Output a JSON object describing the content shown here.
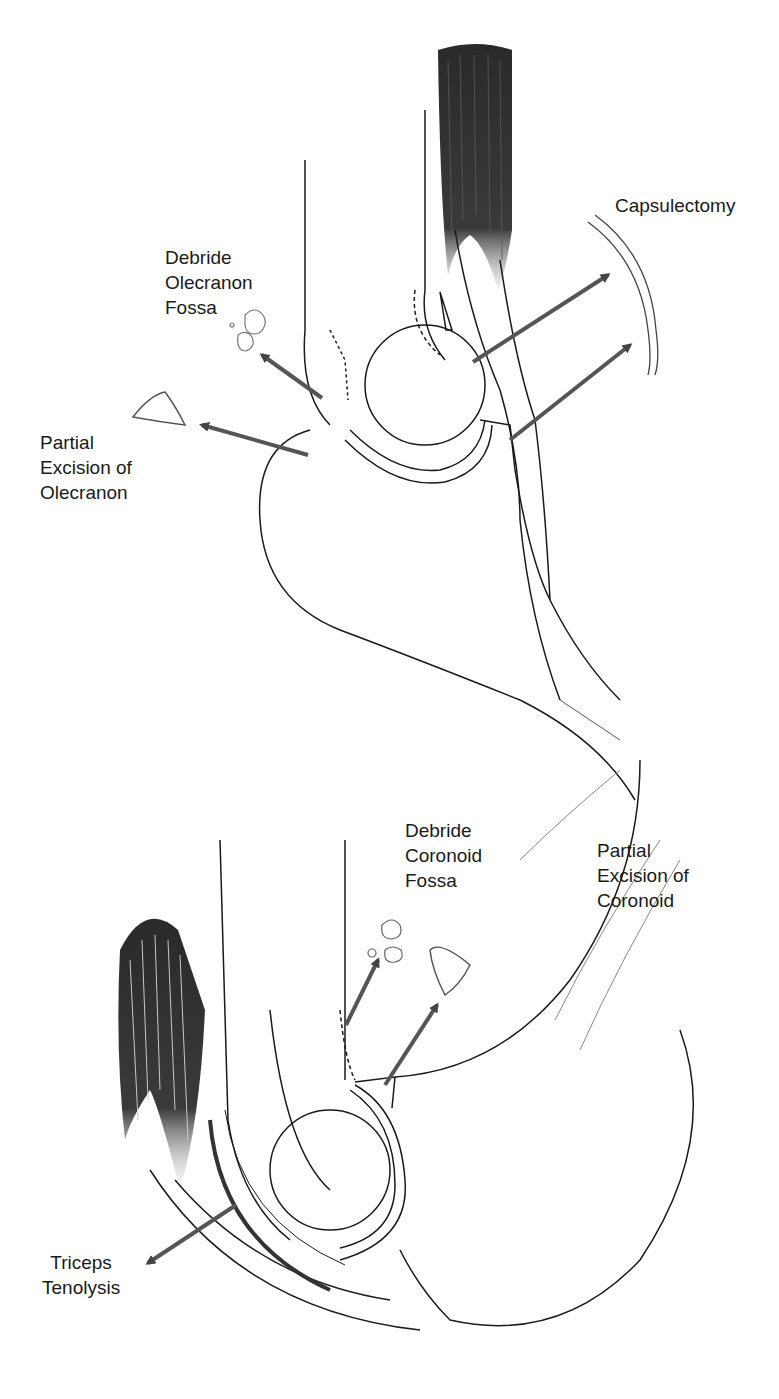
{
  "figure": {
    "panels": [
      {
        "id": "posterior",
        "labels": [
          {
            "key": "capsulectomy",
            "text": "Capsulectomy"
          },
          {
            "key": "debride_olecranon",
            "text": "Debride\nOlecranon\nFossa"
          },
          {
            "key": "excision_olecranon",
            "text": "Partial\nExcision of\nOlecranon"
          }
        ]
      },
      {
        "id": "anterior",
        "labels": [
          {
            "key": "debride_coronoid",
            "text": "Debride\nCoronoid\nFossa"
          },
          {
            "key": "excision_coronoid",
            "text": "Partial\nExcision of\nCoronoid"
          },
          {
            "key": "triceps",
            "text": "Triceps\nTenolysis"
          }
        ]
      }
    ],
    "colors": {
      "line": "#1a1a1a",
      "arrow": "#555555",
      "muscle": "#333333",
      "background": "#ffffff"
    }
  }
}
